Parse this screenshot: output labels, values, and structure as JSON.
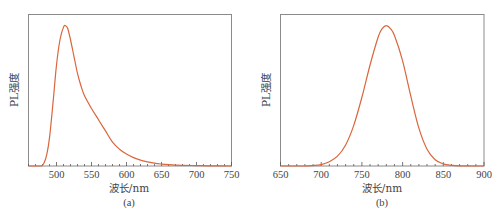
{
  "chart_data": [
    {
      "type": "line",
      "panel_label": "(a)",
      "xlabel": "波长/nm",
      "ylabel": "PL强度",
      "xlim": [
        460,
        750
      ],
      "ylim": [
        0,
        1.08
      ],
      "xticks": [
        500,
        550,
        600,
        650,
        700,
        750
      ],
      "xtick_labels": [
        "500",
        "550",
        "600",
        "650",
        "700",
        "750"
      ],
      "yticks": [],
      "grid": false,
      "legend": null,
      "series": [
        {
          "name": "PL",
          "color": "#d9663c",
          "x": [
            460,
            470,
            478,
            482,
            486,
            490,
            495,
            500,
            505,
            510,
            513,
            516,
            520,
            525,
            530,
            535,
            540,
            550,
            560,
            570,
            580,
            590,
            600,
            610,
            620,
            630,
            640,
            650,
            660,
            680,
            700,
            720,
            750
          ],
          "y": [
            0.0,
            0.0,
            0.0,
            0.02,
            0.08,
            0.2,
            0.45,
            0.72,
            0.9,
            0.99,
            1.0,
            0.98,
            0.9,
            0.78,
            0.66,
            0.57,
            0.5,
            0.41,
            0.33,
            0.25,
            0.17,
            0.12,
            0.085,
            0.06,
            0.042,
            0.03,
            0.02,
            0.014,
            0.01,
            0.005,
            0.003,
            0.001,
            0.0
          ]
        }
      ]
    },
    {
      "type": "line",
      "panel_label": "(b)",
      "xlabel": "波长/nm",
      "ylabel": "PL强度",
      "xlim": [
        650,
        900
      ],
      "ylim": [
        0,
        1.08
      ],
      "xticks": [
        650,
        700,
        750,
        800,
        850,
        900
      ],
      "xtick_labels": [
        "650",
        "700",
        "750",
        "800",
        "850",
        "900"
      ],
      "yticks": [],
      "grid": false,
      "legend": null,
      "series": [
        {
          "name": "PL",
          "color": "#d9663c",
          "x": [
            650,
            680,
            690,
            700,
            710,
            720,
            730,
            740,
            750,
            760,
            770,
            775,
            780,
            785,
            790,
            800,
            810,
            820,
            830,
            840,
            850,
            860,
            870,
            900
          ],
          "y": [
            0.0,
            0.0,
            0.003,
            0.01,
            0.03,
            0.07,
            0.15,
            0.29,
            0.49,
            0.72,
            0.92,
            0.98,
            1.0,
            0.98,
            0.93,
            0.75,
            0.5,
            0.27,
            0.12,
            0.045,
            0.015,
            0.005,
            0.001,
            0.0
          ]
        }
      ]
    }
  ]
}
